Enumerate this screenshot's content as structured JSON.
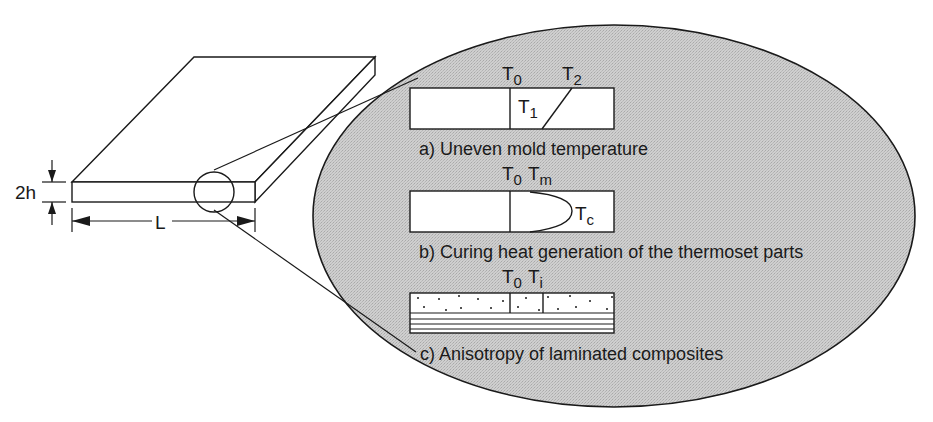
{
  "figure": {
    "plate": {
      "thickness_label": "2h",
      "length_label": "L"
    },
    "panels": [
      {
        "caption": "a) Uneven mold temperature",
        "labels": [
          {
            "base": "T",
            "sub": "0"
          },
          {
            "base": "T",
            "sub": "2"
          },
          {
            "base": "T",
            "sub": "1"
          }
        ]
      },
      {
        "caption": "b) Curing heat generation of the thermoset parts",
        "labels": [
          {
            "base": "T",
            "sub": "0"
          },
          {
            "base": "T",
            "sub": "m"
          },
          {
            "base": "T",
            "sub": "c"
          }
        ]
      },
      {
        "caption": "c) Anisotropy of laminated composites",
        "labels": [
          {
            "base": "T",
            "sub": "0"
          },
          {
            "base": "T",
            "sub": "i"
          }
        ]
      }
    ],
    "colors": {
      "ellipse_fill": "#c8c8c8",
      "line": "#1a1a1a",
      "box_fill": "#ffffff"
    }
  }
}
